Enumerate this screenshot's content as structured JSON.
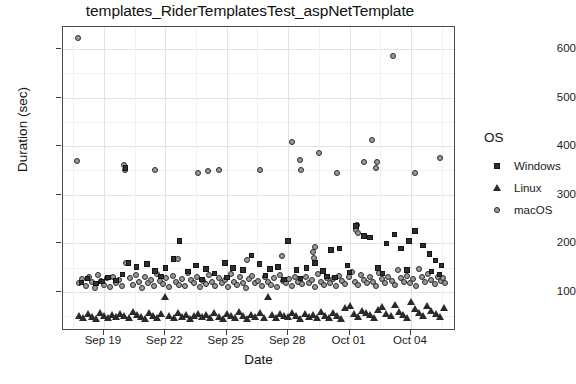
{
  "chart_data": {
    "type": "scatter",
    "title": "templates_RiderTemplatesTest_aspNetTemplate",
    "xlabel": "Date",
    "ylabel": "Duration (sec)",
    "grid": true,
    "legend_position": "right",
    "legend_title": "OS",
    "xlim": [
      "2023-09-17",
      "2023-10-06"
    ],
    "ylim": [
      20,
      645
    ],
    "yticks": [
      100,
      200,
      300,
      400,
      500,
      600
    ],
    "xticks": [
      "Sep 19",
      "Sep 22",
      "Sep 25",
      "Sep 28",
      "Oct 01",
      "Oct 04"
    ],
    "xtick_positions_days": [
      2,
      5,
      8,
      11,
      14,
      17
    ],
    "series": [
      {
        "name": "Windows",
        "marker": "square",
        "color": "#2f2f2f",
        "points": [
          [
            3.05,
            355
          ],
          [
            5.7,
            205
          ],
          [
            3.2,
            160
          ],
          [
            3.6,
            152
          ],
          [
            4.1,
            158
          ],
          [
            4.5,
            143
          ],
          [
            5.0,
            150
          ],
          [
            5.4,
            168
          ],
          [
            6.1,
            142
          ],
          [
            6.5,
            155
          ],
          [
            7.0,
            148
          ],
          [
            7.4,
            138
          ],
          [
            7.9,
            160
          ],
          [
            8.3,
            150
          ],
          [
            8.8,
            146
          ],
          [
            9.2,
            175
          ],
          [
            9.6,
            158
          ],
          [
            10.1,
            148
          ],
          [
            10.5,
            152
          ],
          [
            11.0,
            205
          ],
          [
            11.4,
            145
          ],
          [
            11.9,
            150
          ],
          [
            12.3,
            160
          ],
          [
            12.7,
            143
          ],
          [
            13.1,
            186
          ],
          [
            13.5,
            190
          ],
          [
            13.9,
            155
          ],
          [
            14.3,
            236
          ],
          [
            14.7,
            215
          ],
          [
            15.0,
            212
          ],
          [
            15.4,
            150
          ],
          [
            15.8,
            200
          ],
          [
            16.2,
            218
          ],
          [
            16.5,
            190
          ],
          [
            16.9,
            205
          ],
          [
            17.2,
            225
          ],
          [
            17.6,
            196
          ],
          [
            17.9,
            178
          ],
          [
            18.2,
            165
          ],
          [
            18.5,
            155
          ],
          [
            2.2,
            130
          ],
          [
            2.6,
            124
          ],
          [
            2.9,
            136
          ],
          [
            1.6,
            118
          ],
          [
            1.9,
            122
          ],
          [
            1.2,
            128
          ],
          [
            0.9,
            120
          ],
          [
            4.8,
            132
          ],
          [
            6.8,
            126
          ],
          [
            8.0,
            130
          ],
          [
            9.9,
            134
          ],
          [
            11.6,
            128
          ],
          [
            12.9,
            132
          ],
          [
            14.0,
            140
          ],
          [
            15.6,
            138
          ],
          [
            16.8,
            145
          ],
          [
            18.0,
            142
          ],
          [
            18.4,
            136
          ],
          [
            10.8,
            126
          ],
          [
            13.3,
            130
          ]
        ]
      },
      {
        "name": "Linux",
        "marker": "triangle",
        "color": "#2a2a2a",
        "points": [
          [
            0.8,
            52
          ],
          [
            1.0,
            48
          ],
          [
            1.2,
            55
          ],
          [
            1.4,
            50
          ],
          [
            1.6,
            46
          ],
          [
            1.8,
            58
          ],
          [
            2.0,
            51
          ],
          [
            2.2,
            47
          ],
          [
            2.4,
            53
          ],
          [
            2.6,
            49
          ],
          [
            2.8,
            56
          ],
          [
            3.0,
            52
          ],
          [
            3.2,
            48
          ],
          [
            3.4,
            60
          ],
          [
            3.6,
            54
          ],
          [
            3.8,
            50
          ],
          [
            4.0,
            46
          ],
          [
            4.2,
            57
          ],
          [
            4.4,
            51
          ],
          [
            4.6,
            48
          ],
          [
            4.8,
            55
          ],
          [
            5.0,
            90
          ],
          [
            5.2,
            52
          ],
          [
            5.4,
            47
          ],
          [
            5.6,
            58
          ],
          [
            5.8,
            50
          ],
          [
            6.0,
            54
          ],
          [
            6.2,
            46
          ],
          [
            6.4,
            51
          ],
          [
            6.6,
            56
          ],
          [
            6.8,
            49
          ],
          [
            7.0,
            53
          ],
          [
            7.2,
            47
          ],
          [
            7.4,
            58
          ],
          [
            7.6,
            50
          ],
          [
            7.8,
            45
          ],
          [
            8.0,
            55
          ],
          [
            8.2,
            51
          ],
          [
            8.4,
            48
          ],
          [
            8.6,
            60
          ],
          [
            8.8,
            52
          ],
          [
            9.0,
            46
          ],
          [
            9.2,
            54
          ],
          [
            9.4,
            50
          ],
          [
            9.6,
            57
          ],
          [
            9.8,
            48
          ],
          [
            10.0,
            90
          ],
          [
            10.2,
            53
          ],
          [
            10.4,
            47
          ],
          [
            10.6,
            55
          ],
          [
            10.8,
            51
          ],
          [
            11.0,
            49
          ],
          [
            11.2,
            58
          ],
          [
            11.4,
            52
          ],
          [
            11.6,
            46
          ],
          [
            11.8,
            56
          ],
          [
            12.0,
            50
          ],
          [
            12.2,
            54
          ],
          [
            12.4,
            47
          ],
          [
            12.6,
            60
          ],
          [
            12.8,
            52
          ],
          [
            13.0,
            48
          ],
          [
            13.2,
            57
          ],
          [
            13.4,
            51
          ],
          [
            13.6,
            46
          ],
          [
            13.8,
            68
          ],
          [
            14.0,
            72
          ],
          [
            14.2,
            55
          ],
          [
            14.4,
            50
          ],
          [
            14.6,
            62
          ],
          [
            14.8,
            58
          ],
          [
            15.0,
            53
          ],
          [
            15.2,
            47
          ],
          [
            15.4,
            65
          ],
          [
            15.6,
            70
          ],
          [
            15.8,
            56
          ],
          [
            16.0,
            51
          ],
          [
            16.2,
            75
          ],
          [
            16.4,
            60
          ],
          [
            16.6,
            54
          ],
          [
            16.8,
            48
          ],
          [
            17.0,
            80
          ],
          [
            17.2,
            66
          ],
          [
            17.4,
            57
          ],
          [
            17.6,
            52
          ],
          [
            17.8,
            72
          ],
          [
            18.0,
            62
          ],
          [
            18.2,
            56
          ],
          [
            18.4,
            50
          ],
          [
            18.6,
            68
          ]
        ]
      },
      {
        "name": "macOS",
        "marker": "circle",
        "color": "#9a9a9a",
        "points": [
          [
            0.75,
            623
          ],
          [
            0.7,
            370
          ],
          [
            3.0,
            362
          ],
          [
            3.05,
            350
          ],
          [
            4.5,
            352
          ],
          [
            6.6,
            345
          ],
          [
            7.1,
            348
          ],
          [
            7.6,
            352
          ],
          [
            9.6,
            350
          ],
          [
            11.2,
            408
          ],
          [
            11.6,
            372
          ],
          [
            11.65,
            352
          ],
          [
            12.5,
            385
          ],
          [
            13.4,
            345
          ],
          [
            14.7,
            367
          ],
          [
            15.1,
            412
          ],
          [
            15.3,
            355
          ],
          [
            15.35,
            368
          ],
          [
            16.1,
            585
          ],
          [
            17.2,
            345
          ],
          [
            18.4,
            375
          ],
          [
            0.8,
            118
          ],
          [
            0.95,
            126
          ],
          [
            1.1,
            112
          ],
          [
            1.25,
            130
          ],
          [
            1.4,
            120
          ],
          [
            1.55,
            108
          ],
          [
            1.7,
            135
          ],
          [
            1.85,
            122
          ],
          [
            2.0,
            115
          ],
          [
            2.15,
            128
          ],
          [
            2.3,
            110
          ],
          [
            2.45,
            132
          ],
          [
            2.6,
            118
          ],
          [
            2.75,
            124
          ],
          [
            2.9,
            112
          ],
          [
            3.1,
            160
          ],
          [
            3.25,
            128
          ],
          [
            3.4,
            115
          ],
          [
            3.55,
            136
          ],
          [
            3.7,
            120
          ],
          [
            3.85,
            108
          ],
          [
            4.0,
            130
          ],
          [
            4.15,
            118
          ],
          [
            4.3,
            125
          ],
          [
            4.45,
            112
          ],
          [
            4.6,
            138
          ],
          [
            4.75,
            122
          ],
          [
            4.9,
            116
          ],
          [
            5.05,
            128
          ],
          [
            5.2,
            110
          ],
          [
            5.35,
            134
          ],
          [
            5.5,
            120
          ],
          [
            5.65,
            115
          ],
          [
            5.8,
            126
          ],
          [
            5.95,
            112
          ],
          [
            6.1,
            140
          ],
          [
            6.25,
            124
          ],
          [
            6.4,
            118
          ],
          [
            6.55,
            130
          ],
          [
            6.7,
            110
          ],
          [
            6.85,
            122
          ],
          [
            7.0,
            116
          ],
          [
            7.15,
            135
          ],
          [
            7.3,
            120
          ],
          [
            7.45,
            112
          ],
          [
            7.6,
            128
          ],
          [
            7.75,
            118
          ],
          [
            7.9,
            124
          ],
          [
            8.05,
            110
          ],
          [
            8.2,
            138
          ],
          [
            8.35,
            120
          ],
          [
            8.5,
            115
          ],
          [
            8.65,
            130
          ],
          [
            8.8,
            118
          ],
          [
            8.95,
            108
          ],
          [
            9.1,
            126
          ],
          [
            9.25,
            134
          ],
          [
            9.4,
            118
          ],
          [
            9.55,
            122
          ],
          [
            9.7,
            112
          ],
          [
            9.85,
            130
          ],
          [
            10.0,
            120
          ],
          [
            10.15,
            115
          ],
          [
            10.3,
            128
          ],
          [
            10.45,
            110
          ],
          [
            10.6,
            136
          ],
          [
            10.75,
            122
          ],
          [
            10.9,
            118
          ],
          [
            11.05,
            126
          ],
          [
            11.2,
            112
          ],
          [
            11.35,
            130
          ],
          [
            11.5,
            120
          ],
          [
            11.7,
            116
          ],
          [
            11.85,
            132
          ],
          [
            12.0,
            118
          ],
          [
            12.15,
            124
          ],
          [
            12.3,
            110
          ],
          [
            12.45,
            138
          ],
          [
            12.6,
            120
          ],
          [
            12.75,
            115
          ],
          [
            12.9,
            128
          ],
          [
            13.05,
            118
          ],
          [
            13.2,
            126
          ],
          [
            13.35,
            112
          ],
          [
            13.5,
            134
          ],
          [
            13.65,
            122
          ],
          [
            13.8,
            116
          ],
          [
            13.95,
            130
          ],
          [
            14.1,
            142
          ],
          [
            14.25,
            120
          ],
          [
            14.4,
            115
          ],
          [
            14.55,
            136
          ],
          [
            14.7,
            124
          ],
          [
            14.85,
            118
          ],
          [
            15.0,
            132
          ],
          [
            15.15,
            120
          ],
          [
            15.3,
            112
          ],
          [
            15.45,
            140
          ],
          [
            15.6,
            126
          ],
          [
            15.75,
            118
          ],
          [
            15.9,
            130
          ],
          [
            16.05,
            122
          ],
          [
            16.2,
            115
          ],
          [
            16.35,
            145
          ],
          [
            16.5,
            128
          ],
          [
            16.65,
            120
          ],
          [
            16.8,
            134
          ],
          [
            16.95,
            118
          ],
          [
            17.1,
            126
          ],
          [
            17.25,
            112
          ],
          [
            17.4,
            148
          ],
          [
            17.55,
            130
          ],
          [
            17.7,
            120
          ],
          [
            17.85,
            138
          ],
          [
            18.0,
            124
          ],
          [
            18.15,
            116
          ],
          [
            18.3,
            132
          ],
          [
            18.45,
            122
          ],
          [
            18.55,
            128
          ],
          [
            18.65,
            118
          ],
          [
            14.3,
            228
          ],
          [
            14.35,
            238
          ],
          [
            14.4,
            222
          ],
          [
            12.2,
            182
          ],
          [
            12.25,
            170
          ],
          [
            12.3,
            192
          ],
          [
            5.6,
            168
          ],
          [
            9.0,
            166
          ],
          [
            10.7,
            174
          ]
        ]
      }
    ]
  },
  "legend": {
    "title": "OS",
    "items": [
      {
        "label": "Windows",
        "marker": "square"
      },
      {
        "label": "Linux",
        "marker": "triangle"
      },
      {
        "label": "macOS",
        "marker": "circle"
      }
    ]
  }
}
